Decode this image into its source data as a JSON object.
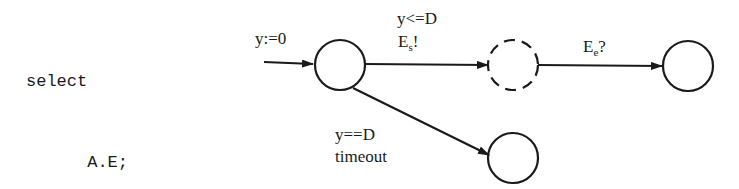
{
  "code": {
    "lines": [
      {
        "indent": 0,
        "text": "select"
      },
      {
        "indent": 1,
        "text": "A.E;"
      },
      {
        "indent": 0,
        "text": "or"
      },
      {
        "indent": 1,
        "text": "delay D;"
      },
      {
        "indent": 0,
        "text": "end select;"
      }
    ]
  },
  "diagram": {
    "initial_label": "y:=0",
    "states": [
      {
        "id": "s0",
        "style": "solid"
      },
      {
        "id": "s1",
        "style": "dashed"
      },
      {
        "id": "s2",
        "style": "solid"
      },
      {
        "id": "s3",
        "style": "solid"
      }
    ],
    "transitions": [
      {
        "from": "s0",
        "to": "s1",
        "guard": "y<=D",
        "action_base": "E",
        "action_sub": "s",
        "action_suffix": "!"
      },
      {
        "from": "s1",
        "to": "s2",
        "action_base": "E",
        "action_sub": "e",
        "action_suffix": "?"
      },
      {
        "from": "s0",
        "to": "s3",
        "guard": "y==D",
        "action": "timeout"
      }
    ]
  },
  "colors": {
    "stroke": "#1a1a1a",
    "background": "#ffffff"
  }
}
